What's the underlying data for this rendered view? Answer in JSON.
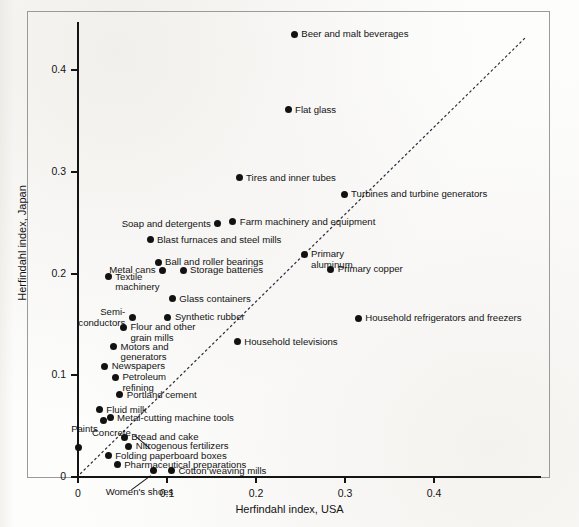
{
  "chart_data": {
    "type": "scatter",
    "title": "",
    "subtitle": "",
    "xlabel": "Herfindahl index, USA",
    "ylabel": "Herfindahl index, Japan",
    "xlim": [
      0,
      0.456
    ],
    "ylim": [
      0,
      0.457
    ],
    "xticks": [
      0,
      0.1,
      0.2,
      0.3,
      0.4
    ],
    "xticklabels": [
      "0",
      "0.1",
      "0.2",
      "0.3",
      "0.4"
    ],
    "yticks": [
      0,
      0.1,
      0.2,
      0.3,
      0.4
    ],
    "yticklabels": [
      "0",
      "0.1",
      "0.2",
      "0.3",
      "0.4"
    ],
    "grid": false,
    "legend": null,
    "annotations": [
      {
        "text": "45-degree reference line (Japan = USA)",
        "style": "dotted diagonal",
        "from": [
          0,
          0
        ],
        "to": [
          0.452,
          0.452
        ]
      }
    ],
    "points": [
      {
        "label": "Beer and malt beverages",
        "x": 0.243,
        "y": 0.435,
        "label_pos": "right"
      },
      {
        "label": "Flat glass",
        "x": 0.236,
        "y": 0.361,
        "label_pos": "right"
      },
      {
        "label": "Tires and inner tubes",
        "x": 0.181,
        "y": 0.294,
        "label_pos": "right"
      },
      {
        "label": "Turbines and turbine generators",
        "x": 0.299,
        "y": 0.278,
        "label_pos": "right"
      },
      {
        "label": "Farm machinery and equipment",
        "x": 0.174,
        "y": 0.251,
        "label_pos": "right"
      },
      {
        "label": "Soap and detergents",
        "x": 0.157,
        "y": 0.249,
        "label_pos": "left"
      },
      {
        "label": "Blast furnaces and steel mills",
        "x": 0.081,
        "y": 0.233,
        "label_pos": "right"
      },
      {
        "label": "Primary\naluminum",
        "x": 0.254,
        "y": 0.219,
        "label_pos": "right"
      },
      {
        "label": "Ball and roller bearings",
        "x": 0.09,
        "y": 0.211,
        "label_pos": "right"
      },
      {
        "label": "Primary copper",
        "x": 0.284,
        "y": 0.204,
        "label_pos": "right"
      },
      {
        "label": "Storage batteries",
        "x": 0.118,
        "y": 0.203,
        "label_pos": "right"
      },
      {
        "label": "Metal cans",
        "x": 0.095,
        "y": 0.203,
        "label_pos": "left"
      },
      {
        "label": "Textile\nmachinery",
        "x": 0.034,
        "y": 0.197,
        "label_pos": "right"
      },
      {
        "label": "Glass containers",
        "x": 0.106,
        "y": 0.175,
        "label_pos": "right"
      },
      {
        "label": "Synthetic rubber",
        "x": 0.101,
        "y": 0.157,
        "label_pos": "right"
      },
      {
        "label": "Semi-\nconductors",
        "x": 0.061,
        "y": 0.157,
        "label_pos": "left"
      },
      {
        "label": "Household refrigerators and freezers",
        "x": 0.315,
        "y": 0.156,
        "label_pos": "right"
      },
      {
        "label": "Flour and other\ngrain mills",
        "x": 0.051,
        "y": 0.147,
        "label_pos": "right"
      },
      {
        "label": "Household televisions",
        "x": 0.179,
        "y": 0.133,
        "label_pos": "right"
      },
      {
        "label": "Motors and\ngenerators",
        "x": 0.04,
        "y": 0.128,
        "label_pos": "right"
      },
      {
        "label": "Newspapers",
        "x": 0.03,
        "y": 0.109,
        "label_pos": "right"
      },
      {
        "label": "Petroleum\nrefining",
        "x": 0.042,
        "y": 0.098,
        "label_pos": "right"
      },
      {
        "label": "Portland cement",
        "x": 0.047,
        "y": 0.081,
        "label_pos": "right"
      },
      {
        "label": "Fluid milk",
        "x": 0.024,
        "y": 0.066,
        "label_pos": "right"
      },
      {
        "label": "Metal-cutting machine tools",
        "x": 0.036,
        "y": 0.058,
        "label_pos": "right"
      },
      {
        "label": "Paints",
        "x": 0.029,
        "y": 0.056,
        "label_pos": "below-left"
      },
      {
        "label": "Bread and cake",
        "x": 0.052,
        "y": 0.039,
        "label_pos": "right"
      },
      {
        "label": "Nitrogenous fertilizers",
        "x": 0.057,
        "y": 0.03,
        "label_pos": "right"
      },
      {
        "label": "Concrete",
        "x": 0.001,
        "y": 0.029,
        "label_pos": "leader-left"
      },
      {
        "label": "Folding paperboard boxes",
        "x": 0.034,
        "y": 0.021,
        "label_pos": "right"
      },
      {
        "label": "Pharmaceutical preparations",
        "x": 0.044,
        "y": 0.012,
        "label_pos": "right"
      },
      {
        "label": "Cotton weaving mills",
        "x": 0.105,
        "y": 0.006,
        "label_pos": "right"
      },
      {
        "label": "Women's shoes",
        "x": 0.085,
        "y": 0.006,
        "label_pos": "leader-below"
      }
    ]
  },
  "colors": {
    "point": "#121212",
    "axis": "#141414",
    "frame": "#9a9a98",
    "background": "#fdfdfc"
  }
}
